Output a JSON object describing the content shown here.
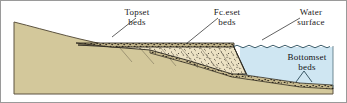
{
  "figure": {
    "name": "delta-cross-section",
    "border_color": "#9a9a9a",
    "background_color": "#ffffff"
  },
  "labels": {
    "topset": {
      "line1": "Topset",
      "line2": "beds"
    },
    "foreset": {
      "line1": "Fc.eset",
      "line2": "beds"
    },
    "water": {
      "line1": "Water",
      "line2": "surface"
    },
    "bottomset": {
      "line1": "Bottomset",
      "line2": "beds"
    }
  },
  "colors": {
    "bedrock": "#d3c89b",
    "bedrock_outline": "#5c5340",
    "water": "#cfe6f2",
    "water_outline": "#4f6d7a",
    "foreset_fill": "#ece2c4",
    "foreset_outline": "#2e2a22",
    "topset_fill": "#bfb287",
    "topset_outline": "#241f18",
    "bottomset_fill": "#c9bd92",
    "stipple": "#3b342a"
  }
}
